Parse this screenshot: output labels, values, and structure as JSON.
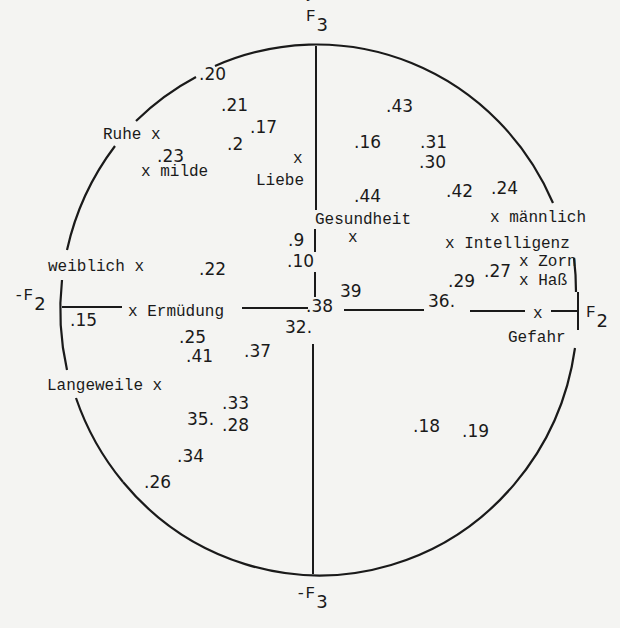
{
  "header": {
    "text": "... 3 ... Systems:"
  },
  "axes": {
    "top": {
      "label": "F",
      "sub": "3",
      "x": 306,
      "y": 21
    },
    "bottom": {
      "label": "-F",
      "sub": "3",
      "x": 296,
      "y": 598
    },
    "left": {
      "label": "-F",
      "sub": "2",
      "x": 14,
      "y": 300
    },
    "right": {
      "label": "F",
      "sub": "2",
      "x": 586,
      "y": 317
    }
  },
  "circle": {
    "cx": 318,
    "cy": 309,
    "rx": 258,
    "ry": 265,
    "stroke": "#1a1a1a"
  },
  "concepts": [
    {
      "text": "Ruhe x",
      "x": 103,
      "y": 139
    },
    {
      "text": "x milde",
      "x": 141,
      "y": 176
    },
    {
      "text": "x",
      "x": 293,
      "y": 163
    },
    {
      "text": "Liebe",
      "x": 256,
      "y": 185
    },
    {
      "text": "Gesundheit",
      "x": 315,
      "y": 224
    },
    {
      "text": "x",
      "x": 348,
      "y": 242
    },
    {
      "text": "x männlich",
      "x": 490,
      "y": 222
    },
    {
      "text": "x Intelligenz",
      "x": 445,
      "y": 248
    },
    {
      "text": "x Zorn",
      "x": 519,
      "y": 266
    },
    {
      "text": "x Haß",
      "x": 519,
      "y": 285
    },
    {
      "text": "weiblich x",
      "x": 48,
      "y": 271
    },
    {
      "text": "x Ermüdung",
      "x": 128,
      "y": 316
    },
    {
      "text": "x",
      "x": 533,
      "y": 318
    },
    {
      "text": "Gefahr",
      "x": 508,
      "y": 342
    },
    {
      "text": "Langeweile x",
      "x": 47,
      "y": 390
    }
  ],
  "points": [
    {
      "text": ".20",
      "x": 199,
      "y": 80
    },
    {
      "text": ".21",
      "x": 221,
      "y": 111
    },
    {
      "text": ".17",
      "x": 250,
      "y": 133
    },
    {
      "text": ".2",
      "x": 227,
      "y": 150
    },
    {
      "text": ".23",
      "x": 157,
      "y": 162
    },
    {
      "text": ".43",
      "x": 386,
      "y": 112
    },
    {
      "text": ".16",
      "x": 354,
      "y": 148
    },
    {
      "text": ".31",
      "x": 420,
      "y": 148
    },
    {
      "text": ".30",
      "x": 419,
      "y": 168
    },
    {
      "text": ".44",
      "x": 354,
      "y": 202
    },
    {
      "text": ".42",
      "x": 446,
      "y": 197
    },
    {
      "text": ".24",
      "x": 491,
      "y": 194
    },
    {
      "text": ".9",
      "x": 288,
      "y": 246
    },
    {
      "text": ".10",
      "x": 287,
      "y": 267
    },
    {
      "text": ".22",
      "x": 199,
      "y": 275
    },
    {
      "text": ".29",
      "x": 448,
      "y": 287
    },
    {
      "text": ".27",
      "x": 484,
      "y": 277
    },
    {
      "text": "39",
      "x": 340,
      "y": 297
    },
    {
      "text": ".38",
      "x": 306,
      "y": 312
    },
    {
      "text": "36.",
      "x": 428,
      "y": 307
    },
    {
      "text": "32.",
      "x": 285,
      "y": 333
    },
    {
      "text": ".15",
      "x": 70,
      "y": 326
    },
    {
      "text": ".25",
      "x": 179,
      "y": 343
    },
    {
      "text": ".41",
      "x": 186,
      "y": 362
    },
    {
      "text": ".37",
      "x": 244,
      "y": 357
    },
    {
      "text": ".33",
      "x": 222,
      "y": 409
    },
    {
      "text": "35.",
      "x": 187,
      "y": 425
    },
    {
      "text": ".28",
      "x": 222,
      "y": 431
    },
    {
      "text": ".34",
      "x": 177,
      "y": 462
    },
    {
      "text": ".26",
      "x": 144,
      "y": 488
    },
    {
      "text": ".18",
      "x": 413,
      "y": 432
    },
    {
      "text": ".19",
      "x": 462,
      "y": 437
    }
  ]
}
